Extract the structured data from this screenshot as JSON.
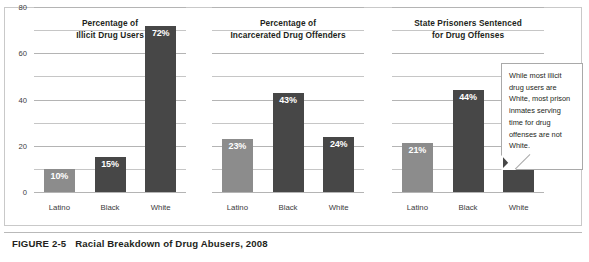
{
  "figure": {
    "number_label": "FIGURE 2-5",
    "caption": "Racial Breakdown of Drug Abusers, 2008"
  },
  "callout": {
    "text": "While most illicit drug users are White, most prison inmates serving time for drug offenses are not White."
  },
  "colors": {
    "bar_latino": "#8c8c8c",
    "bar_black": "#474747",
    "bar_white": "#474747",
    "gridline": "#c6c6c6",
    "frame": "#c9c9c9",
    "text": "#231f20",
    "value_label": "#ffffff"
  },
  "axis": {
    "ticks": [
      "80",
      "60",
      "40",
      "20",
      "0"
    ],
    "tick_values": [
      80,
      60,
      40,
      20,
      0
    ],
    "gridline_values": [
      80,
      70,
      60,
      50,
      40,
      30,
      20,
      10,
      0
    ],
    "ylim": [
      0,
      80
    ]
  },
  "chart_data": [
    {
      "type": "bar",
      "title": "Percentage of\nIllicit Drug Users",
      "title_line1": "Percentage of",
      "title_line2": "Illicit Drug Users",
      "categories": [
        "Latino",
        "Black",
        "White"
      ],
      "values": [
        10,
        15,
        72
      ],
      "value_labels": [
        "10%",
        "15%",
        "72%"
      ],
      "xlabel": "",
      "ylabel": "",
      "ylim": [
        0,
        80
      ],
      "yticks": [
        0,
        20,
        40,
        60,
        80
      ],
      "grid": true,
      "legend": "none",
      "bar_colors": [
        "#8c8c8c",
        "#474747",
        "#474747"
      ]
    },
    {
      "type": "bar",
      "title": "Percentage of\nIncarcerated Drug Offenders",
      "title_line1": "Percentage of",
      "title_line2": "Incarcerated Drug Offenders",
      "categories": [
        "Latino",
        "Black",
        "White"
      ],
      "values": [
        23,
        43,
        24
      ],
      "value_labels": [
        "23%",
        "43%",
        "24%"
      ],
      "xlabel": "",
      "ylabel": "",
      "ylim": [
        0,
        80
      ],
      "yticks": [
        0,
        20,
        40,
        60,
        80
      ],
      "grid": true,
      "legend": "none",
      "bar_colors": [
        "#8c8c8c",
        "#474747",
        "#474747"
      ]
    },
    {
      "type": "bar",
      "title": "State Prisoners Sentenced\nfor Drug Offenses",
      "title_line1": "State Prisoners Sentenced",
      "title_line2": "for Drug Offenses",
      "categories": [
        "Latino",
        "Black",
        "White"
      ],
      "values": [
        21,
        44,
        27
      ],
      "value_labels": [
        "21%",
        "44%",
        "27%"
      ],
      "xlabel": "",
      "ylabel": "",
      "ylim": [
        0,
        80
      ],
      "yticks": [
        0,
        20,
        40,
        60,
        80
      ],
      "grid": true,
      "legend": "none",
      "bar_colors": [
        "#8c8c8c",
        "#474747",
        "#474747"
      ]
    }
  ]
}
